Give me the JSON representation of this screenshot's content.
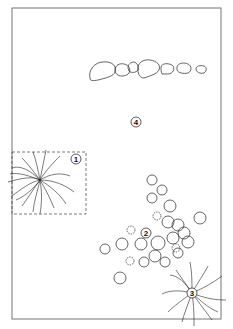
{
  "diagram": {
    "type": "pond planting plan",
    "frame": {
      "x": 12,
      "y": 8,
      "width": 209,
      "height": 311,
      "stroke": "#555555"
    },
    "callouts": [
      {
        "id": 1,
        "label": "1",
        "x": 76,
        "y": 159
      },
      {
        "id": 2,
        "label": "2",
        "x": 146,
        "y": 233
      },
      {
        "id": 3,
        "label": "3",
        "x": 192,
        "y": 293
      },
      {
        "id": 4,
        "label": "4",
        "x": 136,
        "y": 122
      }
    ],
    "elements": {
      "stepping_stones": {
        "count": 7
      },
      "grass_clump_1": {
        "label": "1",
        "bordered": true
      },
      "water_lilies_2": {
        "label": "2"
      },
      "grass_clump_3": {
        "label": "3"
      },
      "open_water_4": {
        "label": "4"
      }
    }
  }
}
